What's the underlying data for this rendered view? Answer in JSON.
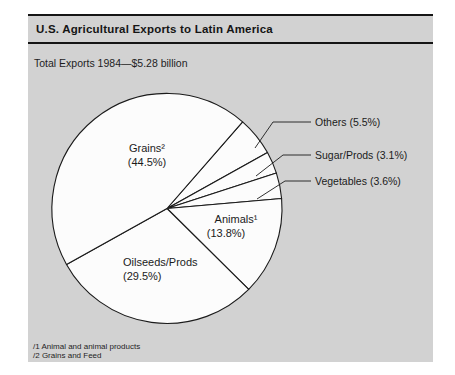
{
  "chart_data": {
    "type": "pie",
    "title": "U.S. Agricultural Exports to Latin America",
    "subtitle": "Total Exports 1984—$5.28 billion",
    "total_label": "Total Exports",
    "year": "1984",
    "total_value": "$5.28 billion",
    "slices": [
      {
        "label": "Others",
        "value": 5.5,
        "placement": "outside"
      },
      {
        "label": "Sugar/Prods",
        "value": 3.1,
        "placement": "outside"
      },
      {
        "label": "Vegetables",
        "value": 3.6,
        "placement": "outside"
      },
      {
        "label": "Animals¹",
        "value": 13.8,
        "placement": "inside"
      },
      {
        "label": "Oilseeds/Prods",
        "value": 29.5,
        "placement": "inside"
      },
      {
        "label": "Grains²",
        "value": 44.5,
        "placement": "inside"
      }
    ],
    "start_angle_deg": 48.9,
    "direction": "clockwise",
    "legend": "none",
    "footnotes": [
      "/1 Animal and animal products",
      "/2 Grains and Feed"
    ],
    "colors": {
      "panel_bg": "#d2d2d2",
      "pie_fill": "#fcfcfc",
      "line": "#1b1b1b",
      "page_bg": "#ffffff"
    }
  }
}
